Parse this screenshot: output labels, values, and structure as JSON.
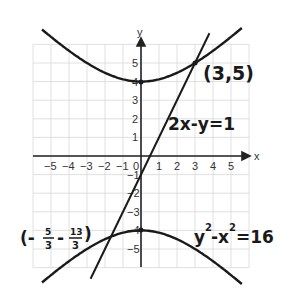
{
  "chart_data": {
    "type": "line",
    "title": "",
    "xlabel": "x",
    "ylabel": "y",
    "xlim": [
      -6,
      6
    ],
    "ylim": [
      -6,
      6
    ],
    "grid": true,
    "x_ticks": [
      "-5",
      "-4",
      "-3",
      "-2",
      "-1",
      "0",
      "1",
      "2",
      "3",
      "4",
      "5"
    ],
    "y_ticks": [
      "5",
      "4",
      "3",
      "2",
      "1",
      "-1",
      "-2",
      "-3",
      "-4",
      "-5"
    ],
    "series": [
      {
        "name": "2x-y=1",
        "kind": "line",
        "equation": "y = 2x - 1"
      },
      {
        "name": "y^2-x^2=16",
        "kind": "hyperbola",
        "equation": "y^2 - x^2 = 16",
        "branches": [
          "upper",
          "lower"
        ]
      }
    ],
    "intersections": [
      {
        "x": 3,
        "y": 5,
        "label": "(3,5)"
      },
      {
        "x": -1.667,
        "y": -4.333,
        "label": "(-5/3, -13/3)"
      }
    ],
    "annotations": [
      {
        "text": "(3,5)",
        "position": "upper-right of intersection"
      },
      {
        "text": "2x-y=1",
        "position": "right of line"
      },
      {
        "text": "y²-x²=16",
        "position": "lower right"
      },
      {
        "text": "(-5/3, -13/3)",
        "position": "lower left"
      }
    ]
  },
  "labels": {
    "x_axis": "x",
    "y_axis": "y",
    "point_a": "(3,5)",
    "line_eq": "2x-y=1",
    "hyperbola_eq_y": "y",
    "hyperbola_eq_rest": "-x",
    "hyperbola_eq_end": "=16",
    "sq": "2",
    "point_b_open": "(-",
    "point_b_x_num": "5",
    "point_b_x_den": "3",
    "point_b_mid": "-",
    "point_b_y_num": "13",
    "point_b_y_den": "3",
    "point_b_close": ")"
  }
}
